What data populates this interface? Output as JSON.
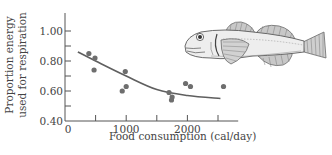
{
  "chart_data": {
    "type": "scatter",
    "title": "",
    "xlabel": "Food consumption (cal/day)",
    "ylabel_lines": [
      "Proportion energy",
      "used for respiration"
    ],
    "ylabel": "Proportion energy used for respiration",
    "xlim": [
      0,
      2830
    ],
    "ylim": [
      0.4,
      1.12
    ],
    "x_ticks": [
      0,
      1000,
      2000
    ],
    "x_tick_labels": [
      "0",
      "1000",
      "2000"
    ],
    "x_minor_ticks": [
      500,
      1500,
      2500
    ],
    "y_ticks": [
      0.4,
      0.6,
      0.8,
      1.0
    ],
    "y_tick_labels": [
      "0.40",
      "0.60",
      "0.80",
      "1.00"
    ],
    "y_minor_ticks": [
      0.5,
      0.7,
      0.9
    ],
    "grid": false,
    "legend": null,
    "series": [
      {
        "name": "observations",
        "kind": "points",
        "points": [
          {
            "x": 390,
            "y": 0.85
          },
          {
            "x": 490,
            "y": 0.82
          },
          {
            "x": 475,
            "y": 0.74
          },
          {
            "x": 985,
            "y": 0.73
          },
          {
            "x": 1000,
            "y": 0.63
          },
          {
            "x": 935,
            "y": 0.6
          },
          {
            "x": 1700,
            "y": 0.59
          },
          {
            "x": 1750,
            "y": 0.56
          },
          {
            "x": 1740,
            "y": 0.54
          },
          {
            "x": 1970,
            "y": 0.65
          },
          {
            "x": 2050,
            "y": 0.63
          },
          {
            "x": 2590,
            "y": 0.63
          }
        ]
      },
      {
        "name": "fitted curve",
        "kind": "line",
        "points": [
          {
            "x": 210,
            "y": 0.86
          },
          {
            "x": 500,
            "y": 0.8
          },
          {
            "x": 1000,
            "y": 0.7
          },
          {
            "x": 1500,
            "y": 0.61
          },
          {
            "x": 2000,
            "y": 0.57
          },
          {
            "x": 2540,
            "y": 0.55
          }
        ]
      }
    ],
    "annotations": [
      {
        "type": "illustration",
        "subject": "fish (sculpin) drawing",
        "position": "upper-right"
      }
    ]
  },
  "style": {
    "axis_color": "#555555",
    "point_color": "#6e6e6e",
    "curve_color": "#5f5f5f"
  },
  "illustration": {
    "icon": "fish-illustration"
  }
}
